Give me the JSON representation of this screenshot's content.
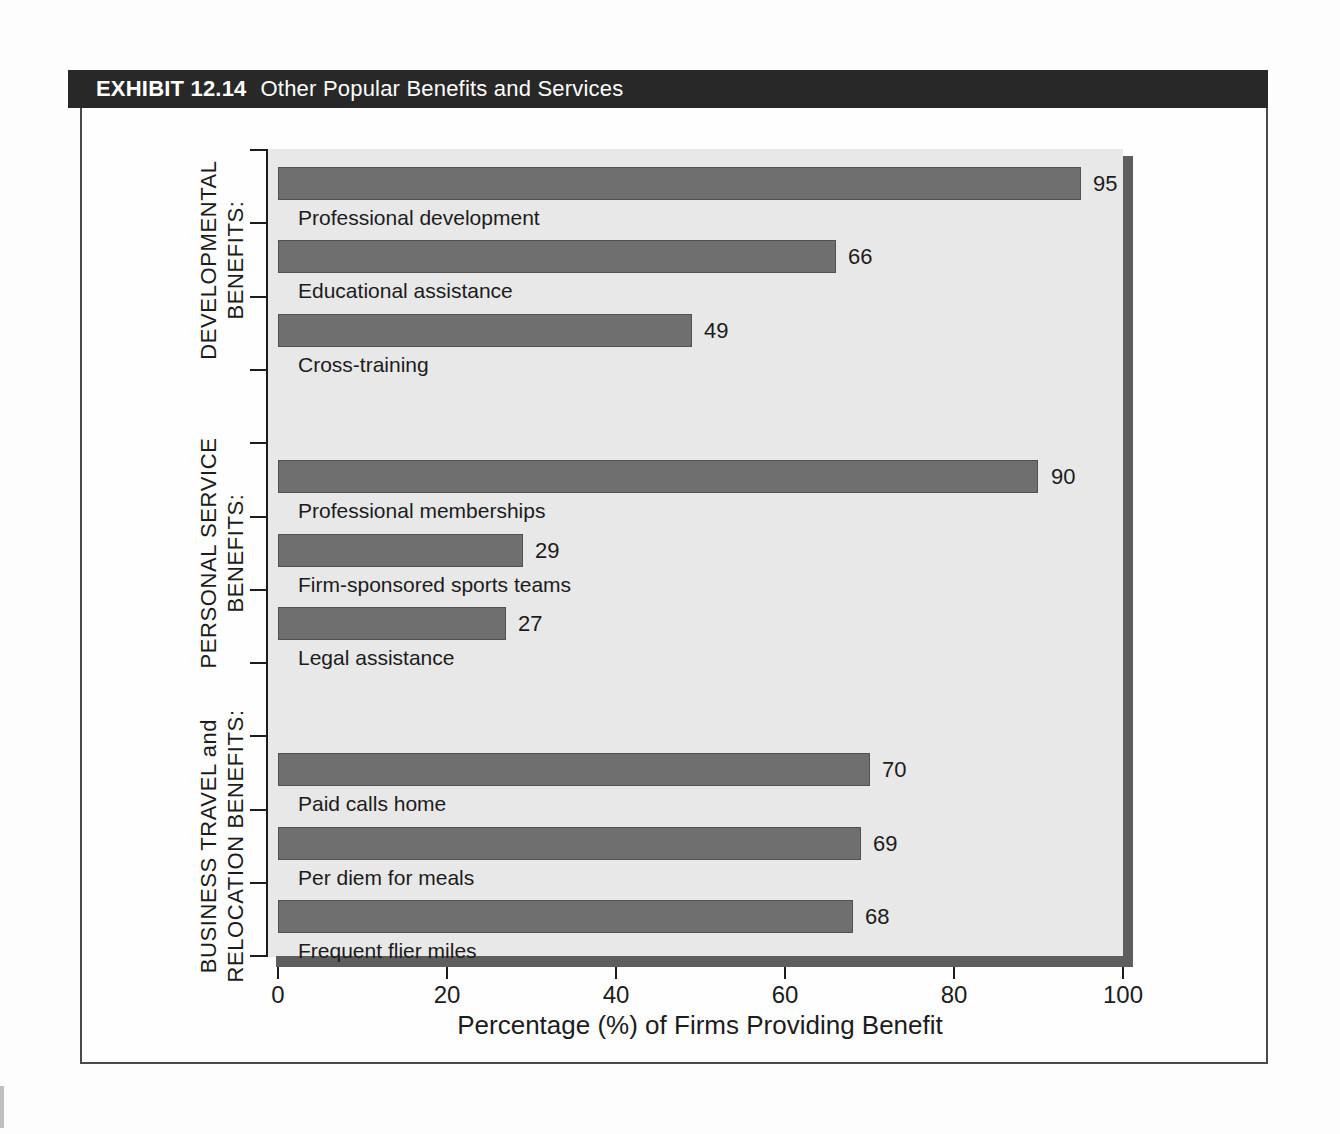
{
  "exhibit": {
    "label": "EXHIBIT 12.14",
    "title": "Other Popular Benefits and Services"
  },
  "chart_data": {
    "type": "bar",
    "orientation": "horizontal",
    "title": "Other Popular Benefits and Services",
    "xlabel": "Percentage (%) of Firms Providing Benefit",
    "xlim": [
      0,
      100
    ],
    "x_ticks": [
      0,
      20,
      40,
      60,
      80,
      100
    ],
    "value_labels_shown": true,
    "groups": [
      {
        "label_lines": [
          "DEVELOPMENTAL",
          "BENEFITS:"
        ],
        "items": [
          {
            "label": "Professional development",
            "value": 95
          },
          {
            "label": "Educational assistance",
            "value": 66
          },
          {
            "label": "Cross-training",
            "value": 49
          }
        ]
      },
      {
        "label_lines": [
          "PERSONAL SERVICE",
          "BENEFITS:"
        ],
        "items": [
          {
            "label": "Professional memberships",
            "value": 90
          },
          {
            "label": "Firm-sponsored sports teams",
            "value": 29
          },
          {
            "label": "Legal assistance",
            "value": 27
          }
        ]
      },
      {
        "label_lines": [
          "BUSINESS TRAVEL and",
          "RELOCATION BENEFITS:"
        ],
        "items": [
          {
            "label": "Paid calls home",
            "value": 70
          },
          {
            "label": "Per diem for meals",
            "value": 69
          },
          {
            "label": "Frequent flier miles",
            "value": 68
          }
        ]
      }
    ]
  },
  "colors": {
    "bar": "#6f6f6f",
    "panel_background": "#e8e8e8",
    "shadow": "#5e5e5e",
    "header_background": "#282828",
    "header_text": "#ffffff",
    "axis": "#1c1c1c"
  }
}
